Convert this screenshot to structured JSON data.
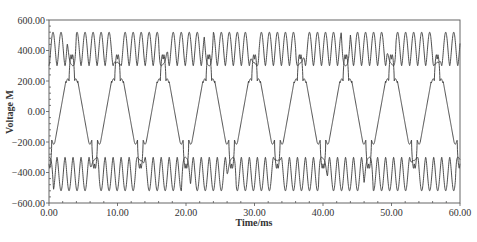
{
  "chart_data": {
    "type": "line",
    "title": "",
    "xlabel": "Time/ms",
    "ylabel": "Voltage M",
    "xlim": [
      0,
      60
    ],
    "ylim": [
      -600,
      600
    ],
    "grid": false,
    "legend": null,
    "x_ticks": [
      0,
      10,
      20,
      30,
      40,
      50,
      60
    ],
    "x_tick_labels": [
      "0.00",
      "10.00",
      "20.00",
      "30.00",
      "40.00",
      "50.00",
      "60.00"
    ],
    "y_ticks": [
      600,
      400,
      200,
      0,
      -200,
      -400,
      -600
    ],
    "y_tick_labels": [
      "600.00",
      "400.00",
      "200.00",
      "0.00",
      "−200.00",
      "−400.00",
      "−600.00"
    ],
    "line_color": "#3a3a3a",
    "series": [
      {
        "name": "upper-trace",
        "description": "High-frequency ripple between ~300 and ~520, with notches every 6.67 ms aligned with the middle-trace positive peaks",
        "period_ms": 6.667,
        "ripple_period_ms": 1.17,
        "min": 300,
        "max": 520,
        "notch_centers_ms": [
          3.33,
          10.0,
          16.67,
          23.33,
          30.0,
          36.67,
          43.33,
          50.0,
          56.67
        ],
        "notch_value": 300
      },
      {
        "name": "middle-trace",
        "description": "Trapezoidal wave, 150 Hz, plateaus near ±200 with sharp double spikes to ±390",
        "period_ms": 6.667,
        "peak_times_ms": [
          3.33,
          10.0,
          16.67,
          23.33,
          30.0,
          36.67,
          43.33,
          50.0,
          56.67
        ],
        "trough_times_ms": [
          0.0,
          6.67,
          13.33,
          20.0,
          26.67,
          33.33,
          40.0,
          46.67,
          53.33,
          60.0
        ],
        "plateau_value": 200,
        "spike_value": 390
      },
      {
        "name": "lower-trace",
        "description": "Mirror of upper trace: ripple between ~-300 and ~-520, notches aligned with middle-trace troughs",
        "period_ms": 6.667,
        "ripple_period_ms": 1.17,
        "min": -520,
        "max": -300,
        "notch_centers_ms": [
          0.0,
          6.67,
          13.33,
          20.0,
          26.67,
          33.33,
          40.0,
          46.67,
          53.33,
          60.0
        ],
        "notch_value": -300
      }
    ]
  }
}
